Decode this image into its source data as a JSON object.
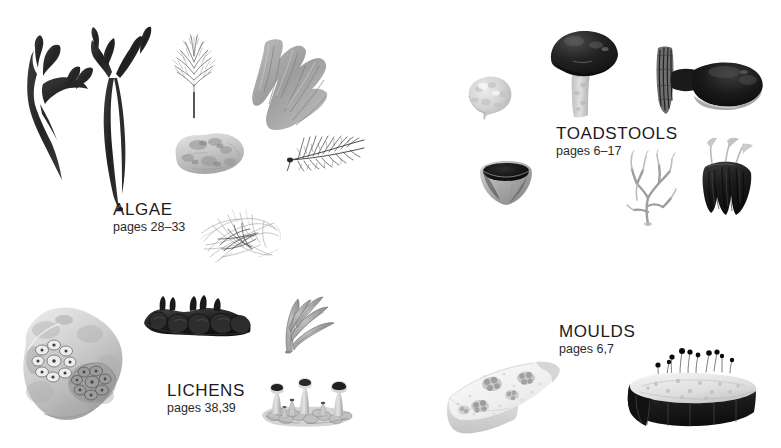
{
  "page": {
    "background_color": "#ffffff",
    "width": 781,
    "height": 448,
    "kind": "illustrated-contents-spread"
  },
  "groups": [
    {
      "id": "algae",
      "title": "ALGAE",
      "pages": "pages 28–33",
      "label_x": 113,
      "label_y": 200,
      "specimen_count": 7,
      "specimens": [
        "dark-branching-seaweed-small",
        "dark-branching-seaweed-tall",
        "feathery-red-alga-bush",
        "fan-blade-seaweed",
        "encrusting-coralline-rock",
        "dark-feather-alga-tuft",
        "tangled-filament-alga-mass"
      ]
    },
    {
      "id": "toadstools",
      "title": "TOADSTOOLS",
      "pages": "pages 6–17",
      "label_x": 556,
      "label_y": 124,
      "specimen_count": 6,
      "specimens": [
        "pale-puffball",
        "dark-capped-mushroom",
        "bracket-fungus-on-bark",
        "cup-fungus",
        "pale-coral-fungus",
        "dark-clustered-fungus-group"
      ]
    },
    {
      "id": "lichens",
      "title": "LICHENS",
      "pages": "pages 38,39",
      "label_x": 167,
      "label_y": 381,
      "specimen_count": 4,
      "specimens": [
        "lichen-covered-boulder",
        "dark-foliose-lichen-mass",
        "grey-strap-branching-lichen",
        "trumpet-cup-lichens"
      ]
    },
    {
      "id": "moulds",
      "title": "MOULDS",
      "pages": "pages 6,7",
      "label_x": 559,
      "label_y": 322,
      "specimen_count": 2,
      "specimens": [
        "mouldy-bread-wedge",
        "pin-mould-bread-slice"
      ]
    }
  ],
  "palette": {
    "ink_dark": "#1b1b1b",
    "seaweed_dark": "#2e2e2e",
    "mid_grey": "#8d8d8d",
    "light_grey": "#c9c9c9",
    "pale_grey": "#e2e2e2",
    "paper": "#ffffff"
  }
}
